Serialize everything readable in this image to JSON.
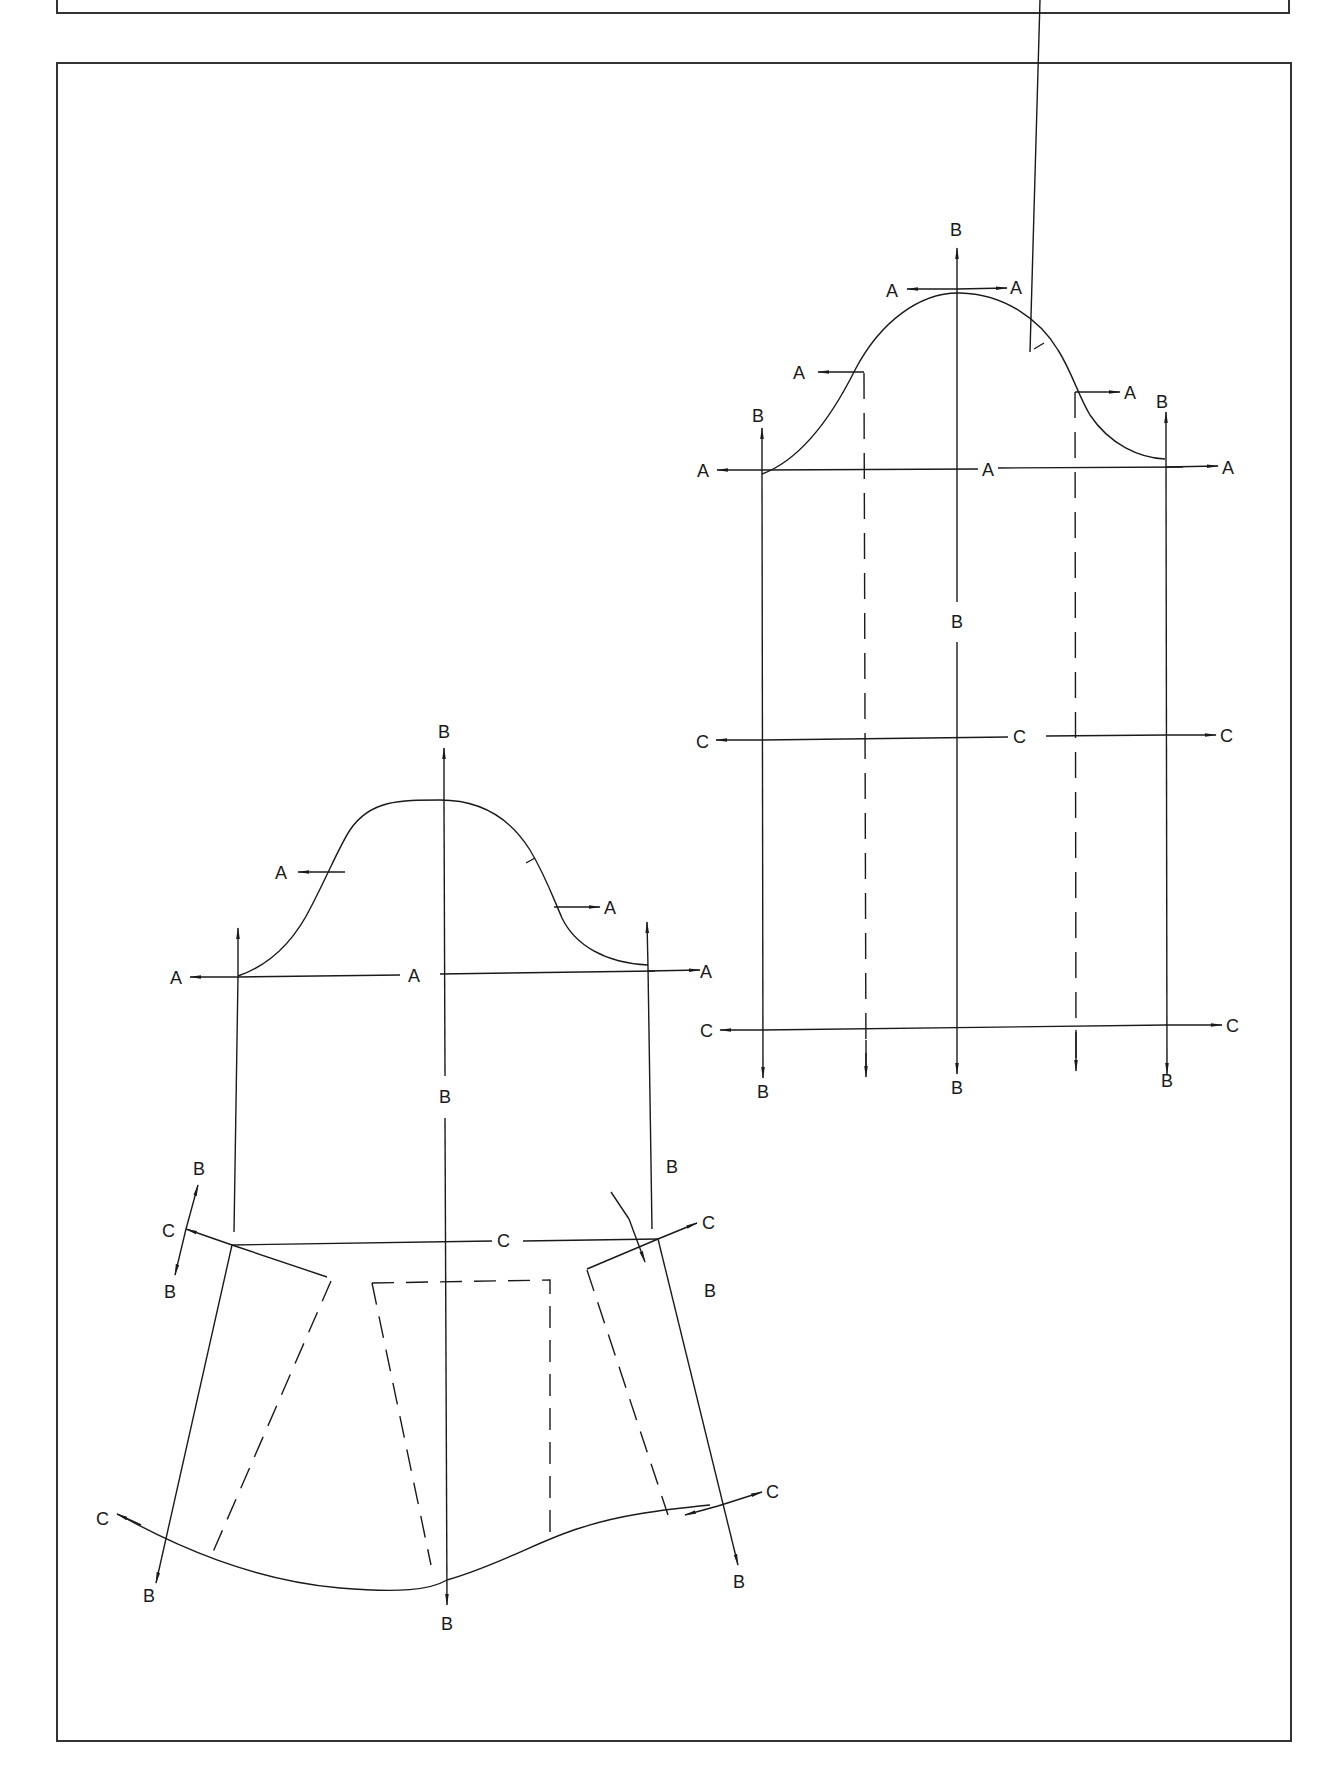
{
  "page": {
    "style": {
      "ink": "#1a1a1a",
      "frame": "#333333",
      "background": "#ffffff"
    }
  },
  "figure_right": {
    "title": "Sleeve block with construction lines (flat)",
    "labels": {
      "top_b": "B",
      "crown_left_a": "A",
      "crown_right_a": "A",
      "upper_left_a": "A",
      "upper_right_a": "A",
      "left_b": "B",
      "right_b": "B",
      "bicep_left_a": "A",
      "bicep_center_a": "A",
      "bicep_right_a": "A",
      "center_b": "B",
      "elbow_left_c": "C",
      "elbow_center_c": "C",
      "elbow_right_c": "C",
      "wrist_left_c": "C",
      "wrist_right_c": "C",
      "bottom_left_b": "B",
      "bottom_center_b": "B",
      "bottom_right_b": "B"
    }
  },
  "figure_left": {
    "title": "Sleeve block flared at hem",
    "labels": {
      "top_b": "B",
      "upper_left_a": "A",
      "upper_right_a": "A",
      "bicep_left_a": "A",
      "bicep_center_a": "A",
      "bicep_right_a": "A",
      "center_b": "B",
      "left_b_up": "B",
      "left_c": "C",
      "left_b_down": "B",
      "right_b_up": "B",
      "right_c": "C",
      "right_b_down": "B",
      "elbow_center_c": "C",
      "hem_left_c": "C",
      "hem_left_b": "B",
      "hem_center_b": "B",
      "hem_right_c": "C",
      "hem_right_b": "B"
    }
  }
}
